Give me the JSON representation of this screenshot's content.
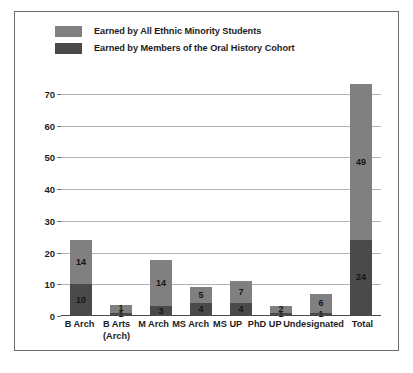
{
  "chart_data": {
    "type": "bar",
    "subtype": "stacked-bar",
    "title": "",
    "xlabel": "",
    "ylabel": "",
    "ylim": [
      0,
      75
    ],
    "yticks": [
      0,
      10,
      20,
      30,
      40,
      50,
      60,
      70
    ],
    "grid": true,
    "legend_position": "top-left",
    "categories": [
      "B Arch",
      "B Arts\n(Arch)",
      "M Arch",
      "MS Arch",
      "MS UP",
      "PhD UP",
      "Undesignated",
      "Total"
    ],
    "series": [
      {
        "name": "Earned by Members of the Oral History Cohort",
        "color": "#4a4a4a",
        "values": [
          10,
          1,
          3,
          4,
          4,
          1,
          1,
          24
        ],
        "labels": [
          "10",
          "1",
          "3",
          "4",
          "4",
          "1",
          "1",
          "24"
        ]
      },
      {
        "name": "Earned by All Ethnic Minority Students",
        "color": "#808080",
        "values": [
          14,
          2.5,
          14.5,
          5,
          7,
          2,
          6,
          49
        ],
        "labels": [
          "14",
          "1",
          "14",
          "5",
          "7",
          "2",
          "6",
          "49"
        ]
      }
    ],
    "totals": [
      24,
      3.5,
      17.5,
      9,
      11,
      4,
      7,
      73
    ]
  },
  "legend": {
    "items": [
      {
        "label": "Earned by All Ethnic Minority Students",
        "color": "#808080",
        "swatch_name": "legend-swatch-light"
      },
      {
        "label": "Earned by Members of the Oral History Cohort",
        "color": "#4a4a4a",
        "swatch_name": "legend-swatch-dark"
      }
    ]
  },
  "colors": {
    "light_gray_bar": "#808080",
    "dark_gray_bar": "#4a4a4a",
    "gridline": "#b2b2b2",
    "axis": "#4a4a4a",
    "frame_border": "#6d6d6d",
    "text": "#1d1d1d",
    "background": "#ffffff"
  }
}
